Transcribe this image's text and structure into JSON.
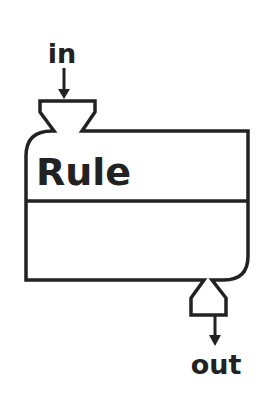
{
  "diagram": {
    "type": "rule-block",
    "input_label": "in",
    "output_label": "out",
    "block_title": "Rule",
    "colors": {
      "stroke": "#222222",
      "fill": "#ffffff",
      "text": "#222222"
    }
  }
}
